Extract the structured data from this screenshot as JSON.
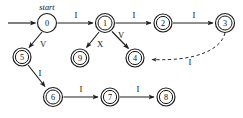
{
  "diagram": {
    "kind": "state-transition-diagram",
    "width": 243,
    "height": 118,
    "background_color": "#ffffff",
    "stroke_color": "#1a1a1a",
    "text_color": "#111111",
    "start_marker": {
      "label": "start",
      "italic": true,
      "target_state": "0"
    },
    "states": [
      {
        "id": "s0",
        "label": "0",
        "cx": 47,
        "cy": 23,
        "r": 9.5,
        "double": false
      },
      {
        "id": "s1",
        "label": "1",
        "cx": 105,
        "cy": 23,
        "r": 9.5,
        "double": true
      },
      {
        "id": "s2",
        "label": "2",
        "cx": 163,
        "cy": 23,
        "r": 9.0,
        "double": true
      },
      {
        "id": "s3",
        "label": "3",
        "cx": 225,
        "cy": 23,
        "r": 9.5,
        "double": true
      },
      {
        "id": "s4",
        "label": "4",
        "cx": 135,
        "cy": 58,
        "r": 9.0,
        "double": true
      },
      {
        "id": "s5",
        "label": "5",
        "cx": 22,
        "cy": 57,
        "r": 9.0,
        "double": true
      },
      {
        "id": "s9",
        "label": "9",
        "cx": 80,
        "cy": 58,
        "r": 9.0,
        "double": true
      },
      {
        "id": "s6",
        "label": "6",
        "cx": 53,
        "cy": 97,
        "r": 9.5,
        "double": true
      },
      {
        "id": "s7",
        "label": "7",
        "cx": 110,
        "cy": 97,
        "r": 9.0,
        "double": true
      },
      {
        "id": "s8",
        "label": "8",
        "cx": 166,
        "cy": 97,
        "r": 9.0,
        "double": true
      }
    ],
    "transitions": [
      {
        "id": "t0_1",
        "from": "0",
        "to": "1",
        "label": "I",
        "label_x": 76,
        "label_y": 15,
        "style": "solid"
      },
      {
        "id": "t1_2",
        "from": "1",
        "to": "2",
        "label": "I",
        "label_x": 134,
        "label_y": 15,
        "style": "solid"
      },
      {
        "id": "t2_3",
        "from": "2",
        "to": "3",
        "label": "I",
        "label_x": 194,
        "label_y": 15,
        "style": "solid"
      },
      {
        "id": "t0_5",
        "from": "0",
        "to": "5",
        "label": "V",
        "label_x": 43,
        "label_y": 44,
        "style": "solid"
      },
      {
        "id": "t1_9",
        "from": "1",
        "to": "9",
        "label": "X",
        "label_x": 100,
        "label_y": 44,
        "style": "solid"
      },
      {
        "id": "t1_4",
        "from": "1",
        "to": "4",
        "label": "V",
        "label_x": 121,
        "label_y": 35,
        "style": "solid"
      },
      {
        "id": "t5_6",
        "from": "5",
        "to": "6",
        "label": "I",
        "label_x": 40,
        "label_y": 73,
        "style": "solid"
      },
      {
        "id": "t6_7",
        "from": "6",
        "to": "7",
        "label": "I",
        "label_x": 81,
        "label_y": 89,
        "style": "solid"
      },
      {
        "id": "t7_8",
        "from": "7",
        "to": "8",
        "label": "I",
        "label_x": 138,
        "label_y": 89,
        "style": "solid"
      },
      {
        "id": "t3_4",
        "from": "3",
        "to": "4",
        "label": "I",
        "label_x": 190,
        "label_y": 62,
        "style": "dashed"
      }
    ]
  }
}
